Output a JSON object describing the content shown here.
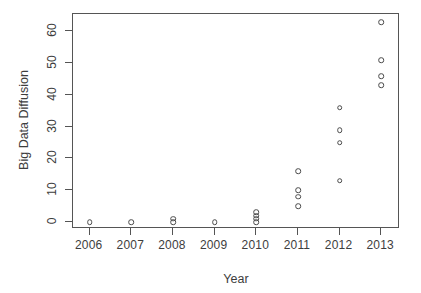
{
  "chart_data": {
    "type": "scatter",
    "title": "",
    "xlabel": "Year",
    "ylabel": "Big Data Diffusion",
    "xlim": [
      2005.6,
      2013.45
    ],
    "ylim": [
      -2.2,
      65.5
    ],
    "grid": false,
    "legend": null,
    "x_ticks": [
      2006,
      2007,
      2008,
      2009,
      2010,
      2011,
      2012,
      2013
    ],
    "x_tick_labels": [
      "2006",
      "2007",
      "2008",
      "2009",
      "2010",
      "2011",
      "2012",
      "2013"
    ],
    "y_ticks": [
      0,
      10,
      20,
      30,
      40,
      50,
      60
    ],
    "y_tick_labels": [
      "0",
      "10",
      "20",
      "30",
      "40",
      "50",
      "60"
    ],
    "marker": "open-circle",
    "marker_color": "#4a4a4a",
    "points": [
      {
        "x": 2006,
        "y": 0
      },
      {
        "x": 2007,
        "y": 0
      },
      {
        "x": 2008,
        "y": 0
      },
      {
        "x": 2008,
        "y": 1
      },
      {
        "x": 2009,
        "y": 0
      },
      {
        "x": 2010,
        "y": 0
      },
      {
        "x": 2010,
        "y": 1
      },
      {
        "x": 2010,
        "y": 2
      },
      {
        "x": 2010,
        "y": 3
      },
      {
        "x": 2011,
        "y": 5
      },
      {
        "x": 2011,
        "y": 8
      },
      {
        "x": 2011,
        "y": 10
      },
      {
        "x": 2011,
        "y": 16
      },
      {
        "x": 2012,
        "y": 13
      },
      {
        "x": 2012,
        "y": 25
      },
      {
        "x": 2012,
        "y": 29
      },
      {
        "x": 2012,
        "y": 36
      },
      {
        "x": 2013,
        "y": 43
      },
      {
        "x": 2013,
        "y": 46
      },
      {
        "x": 2013,
        "y": 51
      },
      {
        "x": 2013,
        "y": 63
      }
    ]
  },
  "figure": {
    "background": "#ffffff",
    "axis_color": "#555555",
    "text_color": "#3d3d3d"
  }
}
